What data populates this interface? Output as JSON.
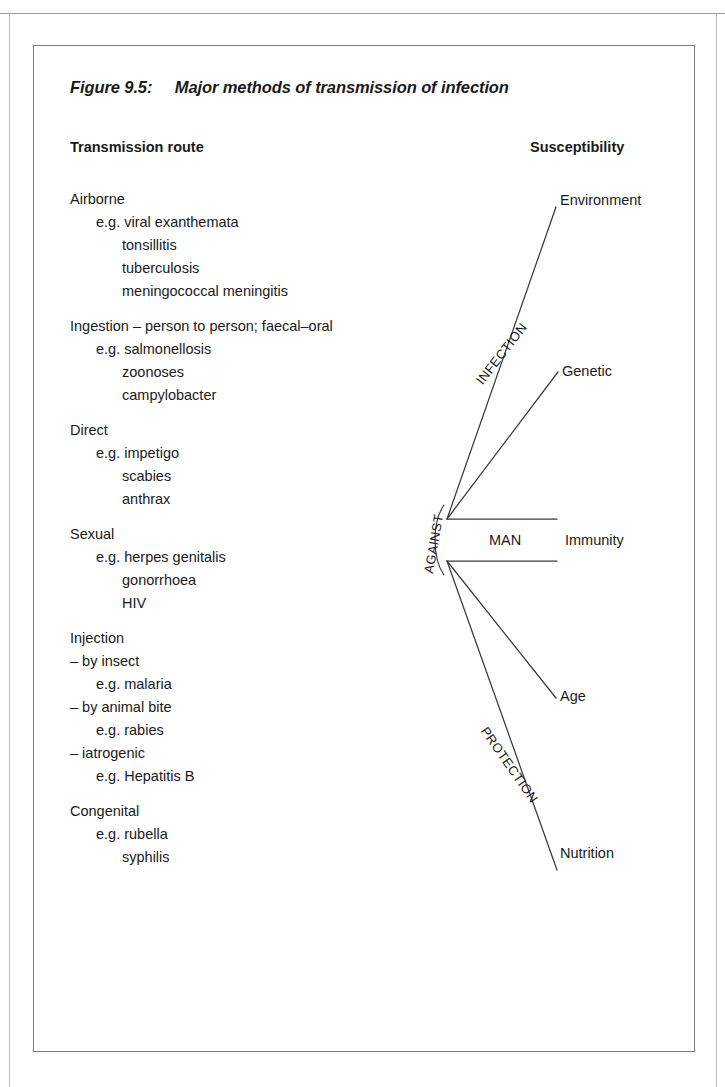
{
  "figure": {
    "number": "Figure 9.5:",
    "title": "Major methods of transmission of infection",
    "title_full": "Figure 9.5:     Major methods of transmission of infection"
  },
  "columns": {
    "left_heading": "Transmission route",
    "right_heading": "Susceptibility"
  },
  "transmission_routes": [
    {
      "name": "Airborne",
      "lines": [
        {
          "text": "Airborne",
          "level": 0
        },
        {
          "text": "e.g. viral exanthemata",
          "level": 1
        },
        {
          "text": "tonsillitis",
          "level": 2
        },
        {
          "text": "tuberculosis",
          "level": 2
        },
        {
          "text": "meningococcal meningitis",
          "level": 2
        }
      ]
    },
    {
      "name": "Ingestion",
      "lines": [
        {
          "text": "Ingestion – person to person; faecal–oral",
          "level": 0
        },
        {
          "text": "e.g. salmonellosis",
          "level": 1
        },
        {
          "text": "zoonoses",
          "level": 2
        },
        {
          "text": "campylobacter",
          "level": 2
        }
      ]
    },
    {
      "name": "Direct",
      "lines": [
        {
          "text": "Direct",
          "level": 0
        },
        {
          "text": "e.g. impetigo",
          "level": 1
        },
        {
          "text": "scabies",
          "level": 2
        },
        {
          "text": "anthrax",
          "level": 2
        }
      ]
    },
    {
      "name": "Sexual",
      "lines": [
        {
          "text": "Sexual",
          "level": 0
        },
        {
          "text": "e.g. herpes genitalis",
          "level": 1
        },
        {
          "text": "gonorrhoea",
          "level": 2
        },
        {
          "text": "HIV",
          "level": 2
        }
      ]
    },
    {
      "name": "Injection",
      "lines": [
        {
          "text": "Injection",
          "level": 0
        },
        {
          "text": "– by insect",
          "level": 0
        },
        {
          "text": "e.g. malaria",
          "level": 1
        },
        {
          "text": "– by animal bite",
          "level": 0
        },
        {
          "text": "e.g. rabies",
          "level": 1
        },
        {
          "text": "– iatrogenic",
          "level": 0
        },
        {
          "text": "e.g. Hepatitis B",
          "level": 1
        }
      ]
    },
    {
      "name": "Congenital",
      "lines": [
        {
          "text": "Congenital",
          "level": 0
        },
        {
          "text": "e.g. rubella",
          "level": 1
        },
        {
          "text": "syphilis",
          "level": 2
        }
      ]
    }
  ],
  "diagram": {
    "center_label": "MAN",
    "axis_labels": [
      {
        "id": "infection",
        "text": "INFECTION",
        "rotation_deg": -52
      },
      {
        "id": "against",
        "text": "AGAINST",
        "rotation_deg": -80
      },
      {
        "id": "protection",
        "text": "PROTECTION",
        "rotation_deg": 55
      }
    ],
    "susceptibility_factors": [
      {
        "id": "environment",
        "label": "Environment"
      },
      {
        "id": "genetic",
        "label": "Genetic"
      },
      {
        "id": "immunity",
        "label": "Immunity"
      },
      {
        "id": "age",
        "label": "Age"
      },
      {
        "id": "nutrition",
        "label": "Nutrition"
      }
    ],
    "colors": {
      "line": "#3a3a3a",
      "border": "#7b7b7b",
      "text": "#1a1a1a",
      "background": "#ffffff"
    }
  }
}
